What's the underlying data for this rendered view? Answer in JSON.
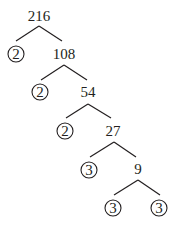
{
  "diagram": {
    "type": "factor-tree",
    "root": "216",
    "levels": [
      {
        "composite": "216",
        "prime": "2",
        "remainder": "108"
      },
      {
        "composite": "108",
        "prime": "2",
        "remainder": "54"
      },
      {
        "composite": "54",
        "prime": "2",
        "remainder": "27"
      },
      {
        "composite": "27",
        "prime": "3",
        "remainder": "9"
      },
      {
        "composite": "9",
        "prime": "3",
        "remainder": "3"
      }
    ],
    "nodes": {
      "n216": "216",
      "p1": "2",
      "n108": "108",
      "p2": "2",
      "n54": "54",
      "p3": "2",
      "n27": "27",
      "p4": "3",
      "n9": "9",
      "p5": "3",
      "p6": "3"
    },
    "prime_factors": [
      "2",
      "2",
      "2",
      "3",
      "3",
      "3"
    ],
    "colors": {
      "ink": "#231f20",
      "background": "#ffffff"
    }
  }
}
